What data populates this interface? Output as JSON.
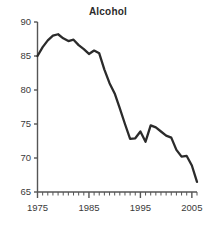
{
  "chart": {
    "title": "Alcohol",
    "colors": {
      "line": "#2b2b2b",
      "axis": "#555555",
      "text": "#3a3a3a",
      "background": "#ffffff"
    }
  },
  "chart_data": {
    "type": "line",
    "title": "Alcohol",
    "xlabel": "",
    "ylabel": "",
    "xlim": [
      1975,
      2006
    ],
    "ylim": [
      65,
      90
    ],
    "grid": false,
    "legend": false,
    "y_ticks": [
      65,
      70,
      75,
      80,
      85,
      90
    ],
    "y_tick_labels": [
      "65",
      "70",
      "75",
      "80",
      "85",
      "90"
    ],
    "x_ticks": [
      1975,
      1985,
      1995,
      2005
    ],
    "x_tick_labels": [
      "1975",
      "1985",
      "1995",
      "2005"
    ],
    "x_minor_tick_interval": 1,
    "series": [
      {
        "name": "Alcohol",
        "x": [
          1975,
          1976,
          1977,
          1978,
          1979,
          1980,
          1981,
          1982,
          1983,
          1984,
          1985,
          1986,
          1987,
          1988,
          1989,
          1990,
          1991,
          1992,
          1993,
          1994,
          1995,
          1996,
          1997,
          1998,
          1999,
          2000,
          2001,
          2002,
          2003,
          2004,
          2005,
          2006
        ],
        "values": [
          85.0,
          86.3,
          87.3,
          88.0,
          88.2,
          87.6,
          87.2,
          87.4,
          86.6,
          86.0,
          85.3,
          85.8,
          85.4,
          83.0,
          81.0,
          79.5,
          77.3,
          75.0,
          72.8,
          72.9,
          73.9,
          72.4,
          74.8,
          74.5,
          73.9,
          73.3,
          73.0,
          71.2,
          70.2,
          70.3,
          68.9,
          66.5
        ]
      }
    ]
  }
}
